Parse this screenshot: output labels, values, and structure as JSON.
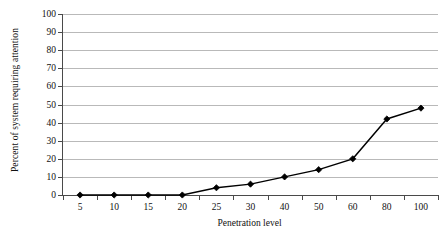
{
  "chart_data": {
    "type": "line",
    "title": "",
    "subtitle": "",
    "xlabel": "Penetration level",
    "ylabel": "Percent of system requiring attention",
    "categories": [
      "5",
      "10",
      "15",
      "20",
      "25",
      "30",
      "40",
      "50",
      "60",
      "80",
      "100"
    ],
    "values": [
      0,
      0,
      0,
      0,
      4,
      6,
      10,
      14,
      20,
      42,
      48
    ],
    "series": [
      {
        "name": "Percent of system requiring attention",
        "values": [
          0,
          0,
          0,
          0,
          4,
          6,
          10,
          14,
          20,
          42,
          48
        ]
      }
    ],
    "ylim": [
      0,
      100
    ],
    "y_ticks": [
      0,
      10,
      20,
      30,
      40,
      50,
      60,
      70,
      80,
      90,
      100
    ],
    "y_tick_labels": [
      "0",
      "10",
      "20",
      "30",
      "40",
      "50",
      "60",
      "70",
      "80",
      "90",
      "100"
    ],
    "x_tick_labels": [
      "5",
      "10",
      "15",
      "20",
      "25",
      "30",
      "40",
      "50",
      "60",
      "80",
      "100"
    ],
    "grid": "horizontal",
    "legend": "none",
    "marker": "diamond",
    "line_color": "#000000",
    "marker_color": "#000000",
    "grid_color": "#b9b9b9",
    "axis_color": "#4a4a4a",
    "background_color": "#ffffff",
    "annotations": []
  }
}
